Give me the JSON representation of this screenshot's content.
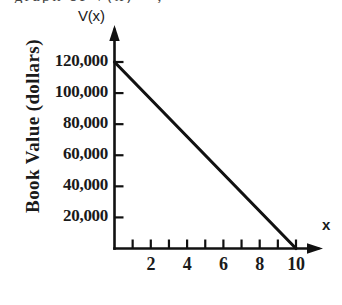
{
  "page": {
    "clipped_caption_fragment": "graph of V(x) = ,"
  },
  "figure": {
    "yaxis_name": "V(x)",
    "xaxis_name": "x",
    "ylabel": "Book  Value  (dollars)",
    "xlabel": "Age"
  },
  "chart_data": {
    "type": "line",
    "title": "",
    "xlabel": "Age",
    "ylabel": "Book Value (dollars)",
    "x_axis_name": "x",
    "y_axis_name": "V(x)",
    "xlim": [
      0,
      11.2
    ],
    "ylim": [
      0,
      132000
    ],
    "grid": false,
    "legend": null,
    "x_major_ticks": [
      2,
      4,
      6,
      8,
      10
    ],
    "x_minor_ticks": [
      1,
      2,
      3,
      4,
      5,
      6,
      7,
      8,
      9,
      10
    ],
    "x_tick_labels": [
      "2",
      "4",
      "6",
      "8",
      "10"
    ],
    "y_ticks": [
      20000,
      40000,
      60000,
      80000,
      100000,
      120000
    ],
    "y_tick_labels": [
      "20,000",
      "40,000",
      "60,000",
      "80,000",
      "100,000",
      "120,000"
    ],
    "series": [
      {
        "name": "V(x)",
        "color": "#111111",
        "x": [
          0,
          10
        ],
        "values": [
          120000,
          0
        ]
      }
    ],
    "annotations": []
  }
}
